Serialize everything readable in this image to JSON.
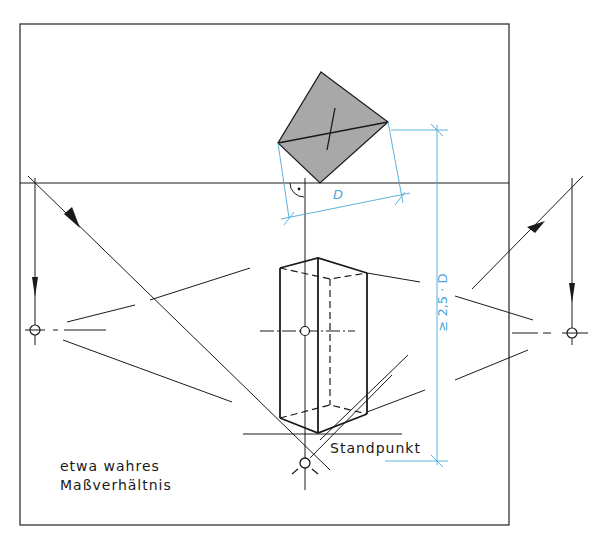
{
  "figure": {
    "caption_top": "... perspective diagram (partially cut off) ...",
    "caption_bottom": "... (partially cut off) ...",
    "labels": {
      "note_line1": "etwa wahres",
      "note_line2": "Maßverhältnis",
      "standpoint": "Standpunkt",
      "dimension_width": "D",
      "dimension_distance": "≥ 2,5 · D"
    },
    "colors": {
      "line": "#1a1a1a",
      "dimension": "#4aa8d8",
      "fill_plan": "#a8a8a8",
      "frame": "#333333"
    }
  }
}
